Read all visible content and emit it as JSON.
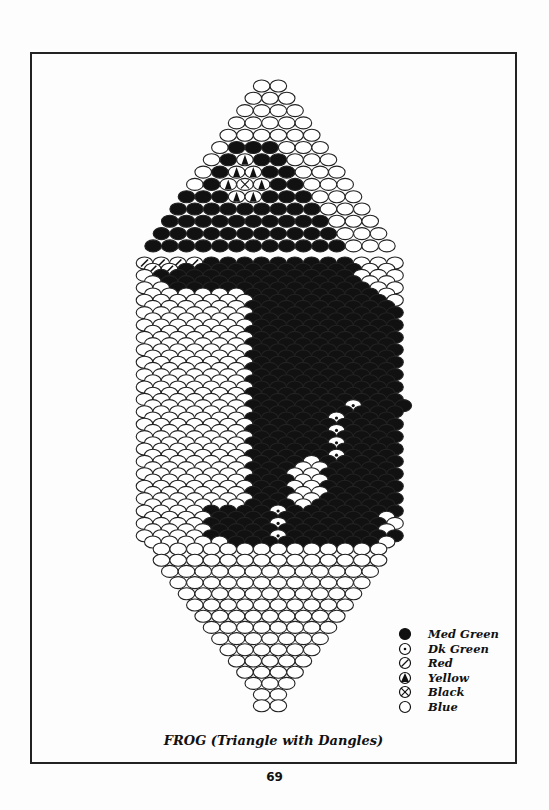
{
  "page": {
    "title": "FROG (Triangle with Dangles)",
    "page_number": "69"
  },
  "legend": [
    {
      "code": "M",
      "icon": "filled-circle-icon",
      "label": "Med Green"
    },
    {
      "code": "D",
      "icon": "dotted-circle-icon",
      "label": "Dk Green"
    },
    {
      "code": "R",
      "icon": "slashed-circle-icon",
      "label": "Red"
    },
    {
      "code": "Y",
      "icon": "triangle-circle-icon",
      "label": "Yellow"
    },
    {
      "code": "K",
      "icon": "crossed-circle-icon",
      "label": "Black"
    },
    {
      "code": "B",
      "icon": "empty-circle-icon",
      "label": "Blue"
    }
  ],
  "pattern": {
    "top_triangle": [
      "BB",
      "BBB",
      "BBBB",
      "BBBBB",
      "BBBBBB",
      "BMMMBBB",
      "BMYMMBBB",
      "BMYYMMBBB",
      "BMYKYMMBBB",
      "MMMYYMMMBBB",
      "MMMMMMMMMBBB",
      "MMMMMMMMMMBBB",
      "MMMMMMMMMMMBBB",
      "MMMMMMMMMMMMBBB"
    ],
    "body": [
      "RRRRMMMMMMMMMBBB",
      "RRMMMMMMMMMMMBB",
      "BMMMMMMMMMMMMBBB",
      "BMMMMMMMMMMMMBB",
      "BBMMMMMMMMMMMMBB",
      "BBBBBBMMMMMMMMB",
      "BBBBBBBMMMMMMMMB",
      "BBBBBBMMMMMMMMM",
      "BBBBBBBMMMMMMMMM",
      "BBBBBBMMMMMMMMM",
      "BBBBBBBMMMMMMMMM",
      "BBBBBBMMMMMMMMM",
      "BBBBBBBMMMMMMMMM",
      "BBBBBBMMMMMMMMM",
      "BBBBBBBMMMMMMMMM",
      "BBBBBBMMMMMMMMM",
      "BBBBBBBMMMMMMMMM",
      "BBBBBBMMMMMMMMM",
      "BBBBBBBMMMMMMMMM",
      "BBBBBBMMMMMMMMM",
      "BBBBBBBMMMMMMMMM",
      "BBBBBBMMMMMMMMM",
      "BBBBBBBMMMMMMMMM",
      "BBBBBBMMMMMMDMMM",
      "BBBBBBBMMMMMMMMM",
      "BBBBBBMMMMMDMMM",
      "BBBBBBBMMMMMMMMM",
      "BBBBBBMMMMMDMMM",
      "BBBBBBBMMMMMMMMM",
      "BBBBBBMMMMMDMMM",
      "BBBBBBBMMMMMMMMM",
      "BBBBBBMMMMMDMMM",
      "BBBBBBBMMMBMMMMM",
      "BBBBBBMMMBBMMMM",
      "BBBBBBBMMBBMMMMM",
      "BBBBBBMMMBBMMMM",
      "BBBBBBBMMBBMMMMM",
      "BBBBBBMMMBBMMMM",
      "BBBBBBBMMBBMMMMM",
      "BBBBBBMMMBMMMMM",
      "BBBBMMMMDMMMMMMM",
      "BBBBMMMMMMMMMMB",
      "BBBBMMMMDMMMMMMB",
      "BBBBMMMMMMMMMMB",
      "BBBBMMMMDMMMMMMM",
      "BBBBBMMMMMMMMMB"
    ],
    "bottom_triangle": [
      "BBBBBBBBBBBBBB",
      "BBBBBBBBBBBBBB",
      "BBBBBBBBBBBBB",
      "BBBBBBBBBBBB",
      "BBBBBBBBBBB",
      "BBBBBBBBBB",
      "BBBBBBBBB",
      "BBBBBBBB",
      "BBBBBBB",
      "BBBBBB",
      "BBBBB",
      "BBBB",
      "BBB",
      "BB",
      "BB"
    ]
  }
}
